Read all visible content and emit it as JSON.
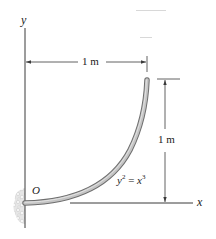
{
  "figure": {
    "axes": {
      "y_label": "y",
      "x_label": "x",
      "origin_label": "O"
    },
    "curve": {
      "equation_lhs": "y",
      "equation_lhs_exp": "2",
      "equation_eq": " = ",
      "equation_rhs": "x",
      "equation_rhs_exp": "3",
      "fill_color": "#bdbdbd",
      "edge_color": "#6e6e6e"
    },
    "dimensions": {
      "horizontal": "1 m",
      "vertical": "1 m"
    },
    "colors": {
      "line": "#3a3a3a",
      "support": "#cfcfcf"
    }
  }
}
